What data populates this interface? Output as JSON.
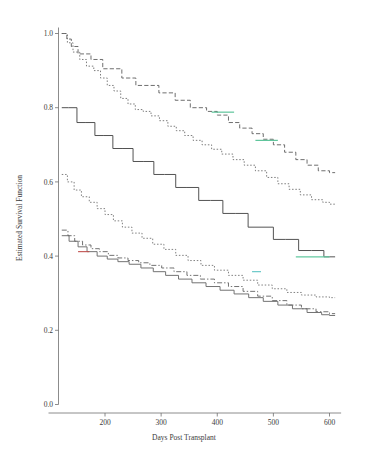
{
  "figure": {
    "title": "",
    "background": "#ffffff"
  },
  "axes": {
    "x_title": "Days Post Transplant",
    "y_title": "Estimated Survival Function",
    "x_ticks": [
      "200",
      "300",
      "400",
      "500",
      "600"
    ],
    "y_ticks": [
      "1.0",
      "0.8",
      "0.6",
      "0.4",
      "0.2",
      "0.0"
    ],
    "axis_color": "#6e6e6e"
  },
  "chart_data": {
    "type": "line",
    "title": "",
    "xlabel": "Days Post Transplant",
    "ylabel": "Estimated Survival Function",
    "xlim": [
      120,
      610
    ],
    "ylim": [
      0.0,
      1.0
    ],
    "xticks": [
      200,
      300,
      400,
      500,
      600
    ],
    "yticks": [
      0.0,
      0.2,
      0.4,
      0.6,
      0.8,
      1.0
    ],
    "grid": false,
    "legend": "none",
    "step": "post",
    "note": "Kaplan-Meier style step curves; six overlapping estimated survival functions",
    "series": [
      {
        "name": "curve-1-upper-dashed",
        "style": "dashed",
        "color": "#555555",
        "x": [
          123,
          132,
          140,
          152,
          163,
          175,
          186,
          196,
          206,
          218,
          230,
          243,
          255,
          268,
          281,
          296,
          311,
          325,
          339,
          352,
          366,
          381,
          400,
          420,
          440,
          462,
          482,
          500,
          520,
          540,
          560,
          580,
          600
        ],
        "y": [
          1.0,
          0.985,
          0.965,
          0.945,
          0.945,
          0.93,
          0.93,
          0.905,
          0.905,
          0.905,
          0.88,
          0.88,
          0.86,
          0.86,
          0.86,
          0.84,
          0.84,
          0.82,
          0.82,
          0.8,
          0.8,
          0.79,
          0.78,
          0.76,
          0.745,
          0.73,
          0.715,
          0.7,
          0.68,
          0.66,
          0.645,
          0.63,
          0.625
        ]
      },
      {
        "name": "curve-2-upper-dotted",
        "style": "dotted",
        "color": "#666666",
        "x": [
          123,
          133,
          143,
          155,
          167,
          180,
          192,
          204,
          216,
          228,
          241,
          254,
          268,
          282,
          297,
          312,
          327,
          342,
          357,
          373,
          390,
          408,
          428,
          448,
          468,
          488,
          508,
          528,
          548,
          568,
          588,
          600
        ],
        "y": [
          1.0,
          0.975,
          0.95,
          0.93,
          0.912,
          0.9,
          0.88,
          0.86,
          0.845,
          0.825,
          0.81,
          0.795,
          0.79,
          0.778,
          0.765,
          0.75,
          0.738,
          0.725,
          0.712,
          0.7,
          0.688,
          0.675,
          0.66,
          0.645,
          0.63,
          0.612,
          0.595,
          0.58,
          0.565,
          0.552,
          0.545,
          0.54
        ]
      },
      {
        "name": "curve-3-solid-middle",
        "style": "solid",
        "color": "#4a4a4a",
        "x": [
          123,
          135,
          150,
          166,
          182,
          198,
          214,
          232,
          250,
          268,
          287,
          306,
          326,
          346,
          367,
          388,
          410,
          432,
          455,
          478,
          500,
          522,
          545,
          568,
          590,
          600
        ],
        "y": [
          0.8,
          0.8,
          0.76,
          0.76,
          0.725,
          0.725,
          0.69,
          0.69,
          0.655,
          0.655,
          0.62,
          0.62,
          0.585,
          0.585,
          0.55,
          0.55,
          0.515,
          0.515,
          0.478,
          0.478,
          0.445,
          0.445,
          0.415,
          0.415,
          0.398,
          0.398
        ]
      },
      {
        "name": "curve-4-lower-dotted",
        "style": "dotted",
        "color": "#6a6a6a",
        "x": [
          123,
          133,
          145,
          158,
          172,
          186,
          200,
          215,
          231,
          248,
          266,
          285,
          305,
          326,
          348,
          371,
          395,
          420,
          446,
          472,
          498,
          524,
          550,
          576,
          600
        ],
        "y": [
          0.62,
          0.6,
          0.578,
          0.56,
          0.545,
          0.528,
          0.512,
          0.495,
          0.478,
          0.462,
          0.448,
          0.432,
          0.418,
          0.402,
          0.388,
          0.375,
          0.362,
          0.348,
          0.335,
          0.322,
          0.312,
          0.302,
          0.295,
          0.29,
          0.288
        ]
      },
      {
        "name": "curve-5-lower-dashdot",
        "style": "dashdot",
        "color": "#5a5a5a",
        "x": [
          123,
          134,
          146,
          160,
          175,
          190,
          206,
          223,
          241,
          260,
          280,
          301,
          323,
          346,
          370,
          395,
          420,
          446,
          472,
          498,
          524,
          550,
          576,
          600
        ],
        "y": [
          0.47,
          0.455,
          0.44,
          0.43,
          0.42,
          0.412,
          0.402,
          0.395,
          0.388,
          0.382,
          0.375,
          0.368,
          0.358,
          0.348,
          0.338,
          0.328,
          0.318,
          0.305,
          0.292,
          0.28,
          0.268,
          0.258,
          0.25,
          0.245
        ]
      },
      {
        "name": "curve-6-lowest-solid",
        "style": "solid",
        "color": "#6b6b6b",
        "x": [
          123,
          136,
          152,
          168,
          186,
          204,
          223,
          243,
          264,
          286,
          308,
          331,
          355,
          380,
          405,
          430,
          456,
          482,
          508,
          534,
          560,
          586,
          600
        ],
        "y": [
          0.455,
          0.44,
          0.425,
          0.412,
          0.4,
          0.392,
          0.385,
          0.378,
          0.368,
          0.358,
          0.348,
          0.338,
          0.328,
          0.318,
          0.308,
          0.298,
          0.288,
          0.278,
          0.268,
          0.258,
          0.248,
          0.242,
          0.24
        ]
      }
    ],
    "accent_segments": [
      {
        "name": "green-segment-upper",
        "color": "#4fbf91",
        "x0": 390,
        "x1": 430,
        "y": 0.788
      },
      {
        "name": "green-segment-middle",
        "color": "#4fbf91",
        "x0": 468,
        "x1": 508,
        "y": 0.712
      },
      {
        "name": "green-segment-solid",
        "color": "#63c9a0",
        "x0": 540,
        "x1": 600,
        "y": 0.398
      },
      {
        "name": "green-segment-lower",
        "color": "#5cc3c3",
        "x0": 462,
        "x1": 478,
        "y": 0.358
      },
      {
        "name": "red-segment-lower",
        "color": "#c0504d",
        "x0": 152,
        "x1": 172,
        "y": 0.412
      }
    ]
  },
  "colors": {
    "background": "#ffffff",
    "axis": "#6e6e6e",
    "text": "#3a3a3a",
    "green_accent": "#4fbf91",
    "red_accent": "#c0504d"
  }
}
